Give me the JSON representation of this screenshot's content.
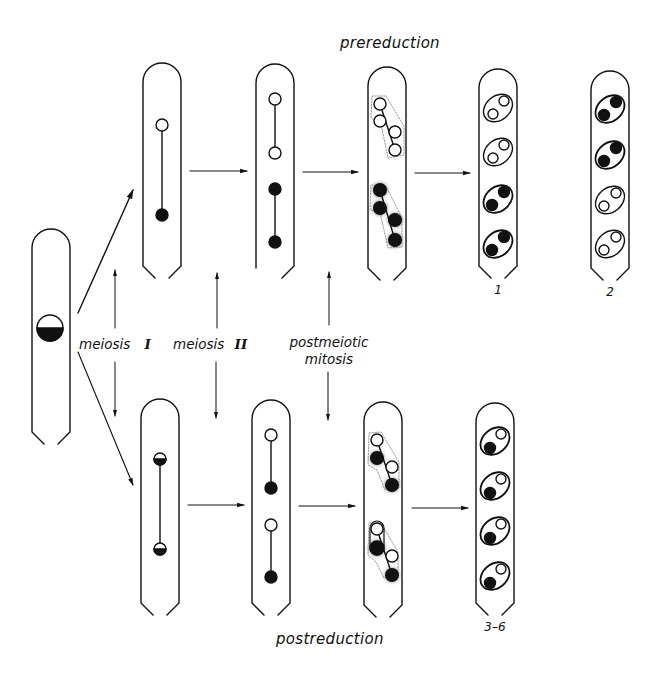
{
  "figure": {
    "title_top": "prereduction",
    "title_bottom": "postreduction",
    "stage_labels": {
      "meiosis1_text": "meiosis",
      "meiosis1_numeral": "I",
      "meiosis2_text": "meiosis",
      "meiosis2_numeral": "II",
      "postmeiotic_line1": "postmeiotic",
      "postmeiotic_line2": "mitosis"
    },
    "ascus_labels": {
      "top_a": "1",
      "top_b": "2",
      "bottom": "3–6"
    },
    "colors": {
      "ink": "#111111",
      "background": "#ffffff",
      "halo": "#9a9a9a"
    }
  },
  "asci": [
    {
      "id": "zygote",
      "x": 32,
      "y": 230,
      "w": 38,
      "h": 215,
      "nuclei": [
        {
          "type": "half",
          "cx": 50,
          "cy": 328,
          "r": 13
        }
      ],
      "links": []
    },
    {
      "id": "top-meiosis1",
      "x": 143,
      "y": 63,
      "w": 38,
      "h": 215,
      "nuclei": [
        {
          "type": "open",
          "cx": 162,
          "cy": 125,
          "r": 6
        },
        {
          "type": "filled",
          "cx": 162,
          "cy": 215,
          "r": 6
        }
      ],
      "links": [
        [
          162,
          131,
          162,
          209
        ]
      ]
    },
    {
      "id": "top-meiosis2",
      "x": 256,
      "y": 64,
      "w": 38,
      "h": 215,
      "nuclei": [
        {
          "type": "open",
          "cx": 275,
          "cy": 99,
          "r": 6
        },
        {
          "type": "open",
          "cx": 275,
          "cy": 153,
          "r": 6
        },
        {
          "type": "filled",
          "cx": 275,
          "cy": 189,
          "r": 6
        },
        {
          "type": "filled",
          "cx": 275,
          "cy": 242,
          "r": 6
        }
      ],
      "links": [
        [
          275,
          105,
          275,
          147
        ],
        [
          275,
          195,
          275,
          236
        ]
      ]
    },
    {
      "id": "top-mitosis",
      "x": 368,
      "y": 67,
      "w": 38,
      "h": 215
    },
    {
      "id": "top-ascus-1",
      "x": 479,
      "y": 69,
      "w": 38,
      "h": 210
    },
    {
      "id": "top-ascus-2",
      "x": 591,
      "y": 71,
      "w": 38,
      "h": 210
    },
    {
      "id": "bot-meiosis1",
      "x": 141,
      "y": 399,
      "w": 38,
      "h": 215
    },
    {
      "id": "bot-meiosis2",
      "x": 252,
      "y": 400,
      "w": 38,
      "h": 215
    },
    {
      "id": "bot-mitosis",
      "x": 364,
      "y": 402,
      "w": 38,
      "h": 215
    },
    {
      "id": "bot-ascus-3-6",
      "x": 476,
      "y": 403,
      "w": 38,
      "h": 213
    }
  ],
  "spore_patterns": {
    "top_ascus_1": [
      "open",
      "open",
      "filled",
      "filled"
    ],
    "top_ascus_2": [
      "filled",
      "filled",
      "open",
      "open"
    ],
    "bottom_ascus_3_6": [
      "mixed",
      "mixed",
      "mixed",
      "mixed"
    ]
  }
}
